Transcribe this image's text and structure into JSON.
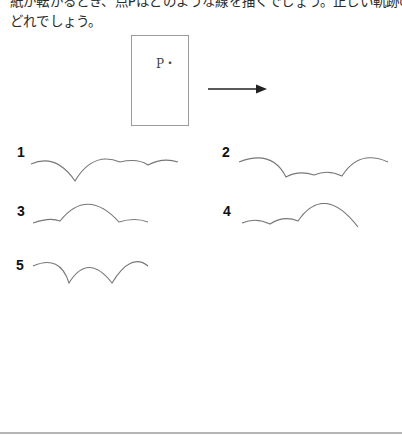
{
  "question": {
    "lines": [
      "紙が転がるとき、点Pはどのような線を描くでしょう。正しい軌跡の図は",
      "どれでしょう。"
    ]
  },
  "figure": {
    "point_label": "P・",
    "arrow_direction": "right"
  },
  "choices": [
    {
      "number": "1",
      "description": "large arch, cusp, then medium arch followed by two small arches"
    },
    {
      "number": "2",
      "description": "large arch, three small dips, large arch"
    },
    {
      "number": "3",
      "description": "small arch, large arch, small arch"
    },
    {
      "number": "4",
      "description": "two small arches followed by a large arch"
    },
    {
      "number": "5",
      "description": "three equal arches with cusps"
    }
  ],
  "colors": {
    "curve": "#777777",
    "box_border": "#9a9a9a",
    "arrow": "#222222",
    "rule": "#b5b5b5"
  }
}
